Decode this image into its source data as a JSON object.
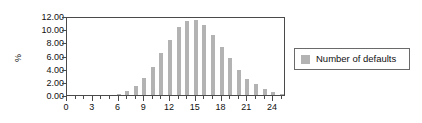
{
  "chart_data": {
    "type": "bar",
    "title": "",
    "xlabel": "",
    "ylabel": "%",
    "xlim": [
      0,
      25.5
    ],
    "ylim": [
      0.0,
      12.0
    ],
    "grid": false,
    "legend_position": "right",
    "series": [
      {
        "name": "Number of defaults",
        "color": "#b3b3b3",
        "x": [
          0,
          1,
          2,
          3,
          4,
          5,
          6,
          7,
          8,
          9,
          10,
          11,
          12,
          13,
          14,
          15,
          16,
          17,
          18,
          19,
          20,
          21,
          22,
          23,
          24,
          25
        ],
        "values": [
          0.0,
          0.0,
          0.0,
          0.0,
          0.0,
          0.0,
          0.1,
          0.55,
          1.35,
          2.6,
          4.25,
          6.4,
          8.35,
          10.3,
          11.2,
          11.35,
          10.6,
          9.15,
          7.3,
          5.55,
          3.85,
          2.5,
          1.6,
          0.85,
          0.4,
          0.15
        ]
      }
    ],
    "yticks": [
      "0.00",
      "2.00",
      "4.00",
      "6.00",
      "8.00",
      "10.00",
      "12.00"
    ],
    "ytick_values": [
      0.0,
      2.0,
      4.0,
      6.0,
      8.0,
      10.0,
      12.0
    ],
    "xticks": [
      "0",
      "3",
      "6",
      "9",
      "12",
      "15",
      "18",
      "21",
      "24"
    ],
    "xtick_values": [
      0,
      3,
      6,
      9,
      12,
      15,
      18,
      21,
      24
    ],
    "xtick_minor_values": [
      0,
      1,
      2,
      3,
      4,
      5,
      6,
      7,
      8,
      9,
      10,
      11,
      12,
      13,
      14,
      15,
      16,
      17,
      18,
      19,
      20,
      21,
      22,
      23,
      24,
      25
    ]
  },
  "legend": {
    "entries": [
      {
        "label": "Number of defaults",
        "color": "#b3b3b3"
      }
    ]
  },
  "axis": {
    "y_title": "%"
  }
}
